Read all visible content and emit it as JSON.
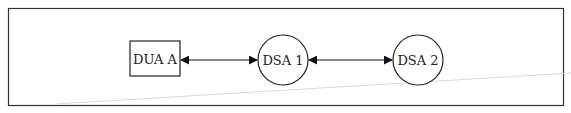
{
  "diagram": {
    "nodes": [
      {
        "id": "dua_a",
        "shape": "rectangle",
        "label": "DUA A"
      },
      {
        "id": "dsa_1",
        "shape": "circle",
        "label": "DSA 1"
      },
      {
        "id": "dsa_2",
        "shape": "circle",
        "label": "DSA 2"
      }
    ],
    "edges": [
      {
        "from": "dua_a",
        "to": "dsa_1",
        "type": "bidirectional-arrow"
      },
      {
        "from": "dsa_1",
        "to": "dsa_2",
        "type": "bidirectional-arrow"
      }
    ],
    "colors": {
      "stroke": "#222222",
      "background": "#ffffff",
      "artifact_line": "#d8d8d8"
    }
  }
}
